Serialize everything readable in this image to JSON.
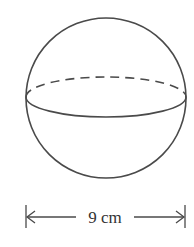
{
  "diagram": {
    "shape": "sphere",
    "dimension": {
      "label": "9 cm",
      "measures": "diameter"
    },
    "colors": {
      "stroke": "#4a4a4a",
      "background": "#ffffff"
    }
  }
}
